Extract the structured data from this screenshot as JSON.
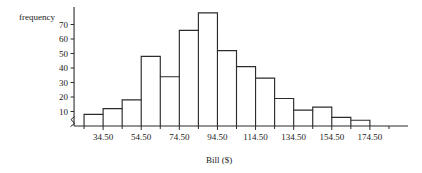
{
  "chart_data": {
    "type": "bar",
    "title": "",
    "xlabel": "Bill ($)",
    "ylabel": "frequency",
    "categories": [
      "24.50-34.50",
      "34.50-44.50",
      "44.50-54.50",
      "54.50-64.50",
      "64.50-74.50",
      "74.50-84.50",
      "84.50-94.50",
      "94.50-104.50",
      "104.50-114.50",
      "114.50-124.50",
      "124.50-134.50",
      "134.50-144.50",
      "144.50-154.50",
      "154.50-164.50",
      "164.50-174.50"
    ],
    "bin_edges": [
      24.5,
      34.5,
      44.5,
      54.5,
      64.5,
      74.5,
      84.5,
      94.5,
      104.5,
      114.5,
      124.5,
      134.5,
      144.5,
      154.5,
      164.5,
      174.5
    ],
    "values": [
      8,
      12,
      18,
      48,
      34,
      66,
      78,
      52,
      41,
      33,
      19,
      11,
      13,
      6,
      4
    ],
    "bin_width": 10,
    "xlim": [
      14.5,
      194.5
    ],
    "ylim": [
      0,
      80
    ],
    "y_ticks": [
      10,
      20,
      30,
      40,
      50,
      60,
      70
    ],
    "y_tick_labels": [
      "10",
      "20",
      "30",
      "40",
      "50",
      "60",
      "70"
    ],
    "x_major_ticks": [
      34.5,
      54.5,
      74.5,
      94.5,
      114.5,
      134.5,
      154.5,
      174.5
    ],
    "x_major_tick_labels": [
      "34.50",
      "54.50",
      "74.50",
      "94.50",
      "114.50",
      "134.50",
      "154.50",
      "174.50"
    ],
    "x_minor_ticks": [
      24.5,
      44.5,
      64.5,
      84.5,
      104.5,
      124.5,
      144.5,
      164.5,
      184.5
    ],
    "grid": false,
    "legend": false,
    "y_axis_break": true,
    "colors": {
      "bar_outline": "#2b2b2b",
      "bar_fill": "none",
      "axis": "#2b2b2b",
      "text": "#1a1a1a",
      "background": "#ffffff"
    }
  }
}
